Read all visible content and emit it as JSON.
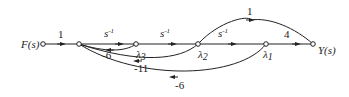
{
  "diagram": {
    "type": "signal-flow-graph",
    "input_label": "F(s)",
    "output_label": "Y(s)",
    "nodes": [
      {
        "id": "F",
        "label": "F(s)"
      },
      {
        "id": "n1",
        "label": ""
      },
      {
        "id": "x3",
        "label": "λ3"
      },
      {
        "id": "x2",
        "label": "λ2"
      },
      {
        "id": "x1",
        "label": "λ1"
      },
      {
        "id": "Y",
        "label": "Y(s)"
      }
    ],
    "edges": [
      {
        "from": "F",
        "to": "n1",
        "gain": "1"
      },
      {
        "from": "n1",
        "to": "x3",
        "gain": "s⁻¹"
      },
      {
        "from": "x3",
        "to": "x2",
        "gain": "s⁻¹"
      },
      {
        "from": "x2",
        "to": "x1",
        "gain": "s⁻¹"
      },
      {
        "from": "x1",
        "to": "Y",
        "gain": "4"
      },
      {
        "from": "x2",
        "to": "Y",
        "gain": "1"
      },
      {
        "from": "x3",
        "to": "n1",
        "gain": "-6"
      },
      {
        "from": "x2",
        "to": "n1",
        "gain": "-11"
      },
      {
        "from": "x1",
        "to": "n1",
        "gain": "-6"
      }
    ],
    "labels": {
      "g_in": "1",
      "g_s1": "s",
      "g_s2": "s",
      "g_s3": "s",
      "sup": "-1",
      "g_4": "4",
      "g_ff": "1",
      "g_fb6a": "-6",
      "g_fb11": "-11",
      "g_fb6b": "-6",
      "lam": "λ",
      "sub3": "3",
      "sub2": "2",
      "sub1": "1"
    }
  }
}
